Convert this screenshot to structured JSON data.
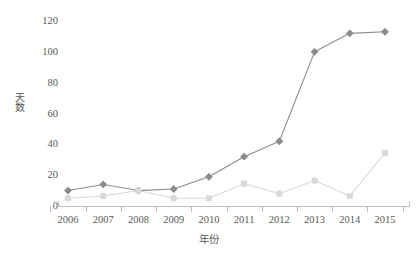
{
  "chart_data": {
    "type": "line",
    "title": "",
    "subtitle": "",
    "xlabel": "年份",
    "ylabel": "天数",
    "categories": [
      "2006",
      "2007",
      "2008",
      "2009",
      "2010",
      "2011",
      "2012",
      "2013",
      "2014",
      "2015"
    ],
    "ytick_labels": [
      "0",
      "20",
      "40",
      "60",
      "80",
      "100",
      "120"
    ],
    "ylim": [
      0,
      120
    ],
    "ytick_step": 20,
    "grid": false,
    "legend": "none",
    "annotations": [],
    "series": [
      {
        "name": "series-dark",
        "color": "#8c8c8c",
        "marker": "diamond",
        "values": [
          10,
          14,
          10,
          11,
          19,
          32,
          42,
          100,
          112,
          113
        ]
      },
      {
        "name": "series-light",
        "color": "#d9d9d9",
        "marker": "square",
        "values": [
          5,
          6.5,
          10,
          5,
          5,
          14.5,
          8,
          16.5,
          6.5,
          34.5
        ]
      }
    ]
  },
  "axes": {
    "axis_color": "#bfbfbf",
    "text_color": "#595959"
  }
}
